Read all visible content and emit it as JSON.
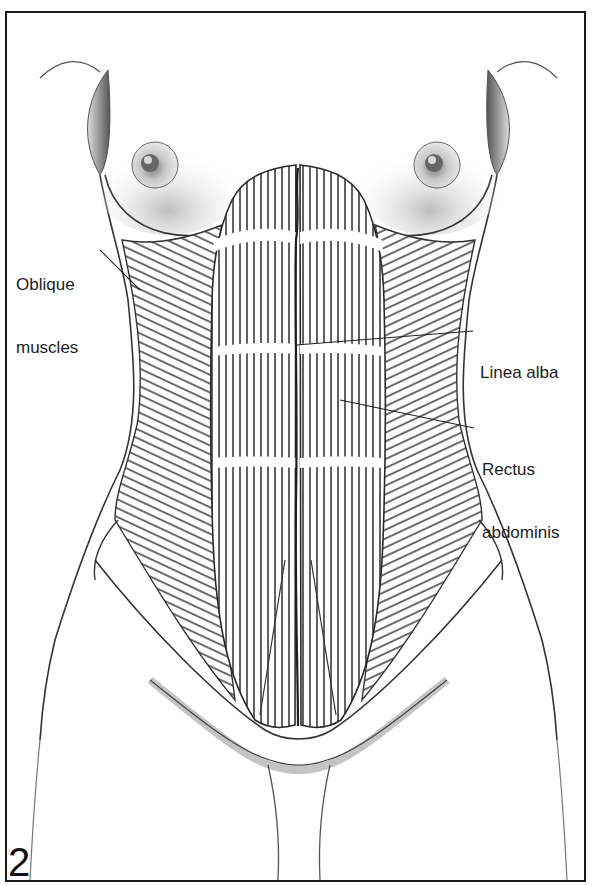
{
  "figure": {
    "number": "2",
    "border_color": "#1a1a1a",
    "line_color": "#2a2a2a"
  },
  "labels": [
    {
      "id": "oblique",
      "line1": "Oblique",
      "line2": "muscles"
    },
    {
      "id": "linea-alba",
      "line1": "Linea alba"
    },
    {
      "id": "rectus",
      "line1": "Rectus",
      "line2": "abdominis"
    }
  ]
}
